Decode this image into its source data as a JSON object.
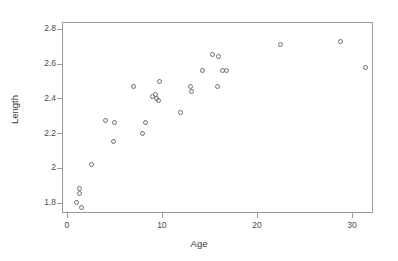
{
  "chart_data": {
    "type": "scatter",
    "title": "",
    "xlabel": "Age",
    "ylabel": "Length",
    "xlim": [
      -0.5,
      32.2
    ],
    "ylim": [
      1.74,
      2.84
    ],
    "xticks": [
      0,
      10,
      20,
      30
    ],
    "xtick_labels": [
      "0",
      "10",
      "20",
      "30"
    ],
    "yticks": [
      1.8,
      2.0,
      2.2,
      2.4,
      2.6,
      2.8
    ],
    "ytick_labels": [
      "1.8",
      "2",
      "2.2",
      "2.4",
      "2.6",
      "2.8"
    ],
    "grid": false,
    "legend": null,
    "marker": "open-circle",
    "marker_color": "#6e6e6e",
    "frame_color": "#9a9a9a",
    "background": "#ffffff",
    "x": [
      1.0,
      1.3,
      1.3,
      1.6,
      2.6,
      4.1,
      4.9,
      5.0,
      7.0,
      8.0,
      8.3,
      9.0,
      9.3,
      9.4,
      9.6,
      9.8,
      12.0,
      13.0,
      13.1,
      14.3,
      15.3,
      15.8,
      16.0,
      16.4,
      16.8,
      22.5,
      28.8,
      31.4
    ],
    "y": [
      1.8,
      1.85,
      1.88,
      1.77,
      2.02,
      2.27,
      2.15,
      2.26,
      2.47,
      2.2,
      2.26,
      2.41,
      2.42,
      2.4,
      2.39,
      2.5,
      2.32,
      2.47,
      2.44,
      2.56,
      2.65,
      2.47,
      2.64,
      2.56,
      2.56,
      2.71,
      2.73,
      2.58
    ],
    "n_points": 28
  }
}
